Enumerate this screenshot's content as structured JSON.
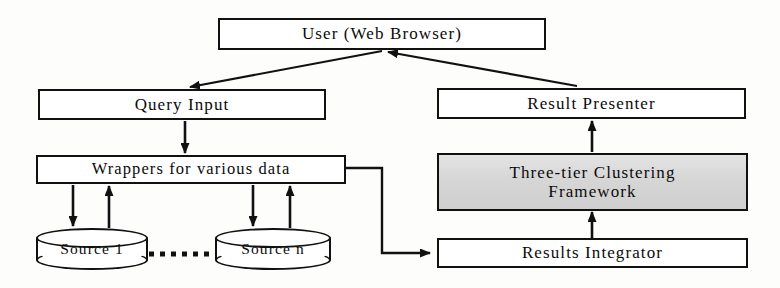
{
  "diagram": {
    "colors": {
      "stroke": "#111111",
      "node_fill": "#ffffff",
      "highlight_fill": "#d8d8d8",
      "background": "#fdfdfc"
    },
    "nodes": [
      {
        "id": "user",
        "label": "User (Web Browser)",
        "shape": "rectangle",
        "fill": "white"
      },
      {
        "id": "query",
        "label": "Query Input",
        "shape": "rectangle",
        "fill": "white"
      },
      {
        "id": "presenter",
        "label": "Result Presenter",
        "shape": "rectangle",
        "fill": "white"
      },
      {
        "id": "wrappers",
        "label": "Wrappers for various data",
        "shape": "rectangle",
        "fill": "white"
      },
      {
        "id": "framework",
        "label": "Three-tier Clustering\nFramework",
        "shape": "rectangle",
        "fill": "gray"
      },
      {
        "id": "integrator",
        "label": "Results Integrator",
        "shape": "rectangle",
        "fill": "white"
      },
      {
        "id": "source1",
        "label": "Source 1",
        "shape": "cylinder",
        "fill": "white"
      },
      {
        "id": "sourcen",
        "label": "Source n",
        "shape": "cylinder",
        "fill": "white"
      }
    ],
    "edges": [
      {
        "from": "user",
        "to": "query",
        "style": "solid",
        "arrow": "end"
      },
      {
        "from": "presenter",
        "to": "user",
        "style": "solid",
        "arrow": "end"
      },
      {
        "from": "query",
        "to": "wrappers",
        "style": "solid",
        "arrow": "end"
      },
      {
        "from": "wrappers",
        "to": "source1",
        "style": "solid",
        "arrow": "end"
      },
      {
        "from": "source1",
        "to": "wrappers",
        "style": "solid",
        "arrow": "end"
      },
      {
        "from": "wrappers",
        "to": "sourcen",
        "style": "solid",
        "arrow": "end"
      },
      {
        "from": "sourcen",
        "to": "wrappers",
        "style": "solid",
        "arrow": "end"
      },
      {
        "from": "wrappers",
        "to": "integrator",
        "style": "solid",
        "arrow": "end"
      },
      {
        "from": "integrator",
        "to": "framework",
        "style": "solid",
        "arrow": "end"
      },
      {
        "from": "framework",
        "to": "presenter",
        "style": "solid",
        "arrow": "end"
      },
      {
        "from": "source1",
        "to": "sourcen",
        "style": "dotted",
        "arrow": "none"
      }
    ]
  }
}
